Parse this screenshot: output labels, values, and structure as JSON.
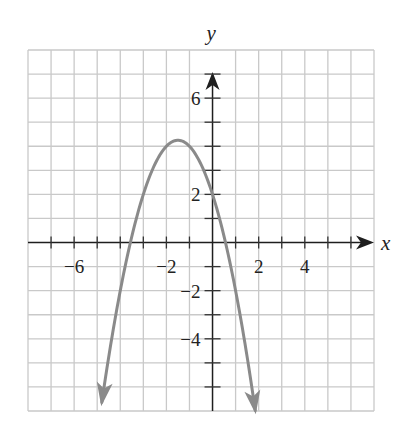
{
  "chart_data": {
    "type": "line",
    "title": "",
    "xlabel": "x",
    "ylabel": "y",
    "xlim": [
      -8,
      7
    ],
    "ylim": [
      -7,
      8
    ],
    "grid": true,
    "x_tick_labels": [
      {
        "value": -6,
        "label": "−6"
      },
      {
        "value": -2,
        "label": "−2"
      },
      {
        "value": 2,
        "label": "2"
      },
      {
        "value": 4,
        "label": "4"
      }
    ],
    "y_tick_labels": [
      {
        "value": 6,
        "label": "6"
      },
      {
        "value": 2,
        "label": "2"
      },
      {
        "value": -2,
        "label": "−2"
      },
      {
        "value": -4,
        "label": "−4"
      }
    ],
    "series": [
      {
        "name": "parabola",
        "equation": "y = -x^2 - 3x + 2",
        "coefficients": {
          "a": -1,
          "b": -3,
          "c": 2
        },
        "x_range": [
          -4.8,
          1.85
        ],
        "vertex": [
          -1.5,
          4.25
        ],
        "y_intercept": 2,
        "x_intercepts": [
          -3.56,
          0.56
        ],
        "arrows_at_ends": true,
        "color": "#8a8a8a"
      }
    ]
  }
}
